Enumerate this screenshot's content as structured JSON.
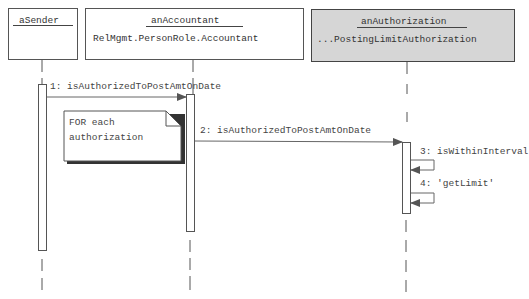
{
  "diagram": {
    "type": "UML sequence diagram",
    "lifelines": [
      {
        "name": "aSender",
        "class": ""
      },
      {
        "name": "anAccountant",
        "class": "RelMgmt.PersonRole.Accountant"
      },
      {
        "name": "anAuthorization",
        "class": "...PostingLimitAuthorization"
      }
    ],
    "messages": [
      {
        "label": "1: isAuthorizedToPostAmtOnDate",
        "from": "aSender",
        "to": "anAccountant"
      },
      {
        "label": "2: isAuthorizedToPostAmtOnDate",
        "from": "anAccountant",
        "to": "anAuthorization"
      },
      {
        "label": "3: isWithinInterval",
        "from": "anAuthorization",
        "to": "anAuthorization"
      },
      {
        "label": "4: 'getLimit'",
        "from": "anAuthorization",
        "to": "anAuthorization"
      }
    ],
    "note": {
      "line1": "FOR each",
      "line2": "authorization"
    },
    "colors": {
      "line": "#555555",
      "shaded_box": "#d6d6d6",
      "background": "#ffffff"
    }
  }
}
